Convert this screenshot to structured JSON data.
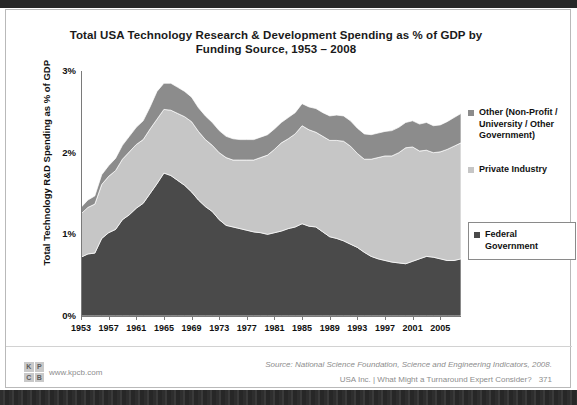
{
  "slide": {
    "title": "Total USA Technology Research & Development Spending as % of GDP by Funding Source, 1953 – 2008",
    "source": "Source: National Science Foundation, Science and Engineering Indicators, 2008.",
    "footer_text": "USA Inc. | What Might a Turnaround Expert Consider?",
    "page_number": "371",
    "brand_url": "www.kpcb.com",
    "brand_letters": [
      "K",
      "P",
      "C",
      "B"
    ]
  },
  "legend": {
    "items": [
      {
        "label": "Other (Non-Profit / University / Other Government)",
        "color": "#8c8c8c",
        "boxed": false
      },
      {
        "label": "Private Industry",
        "color": "#c6c6c6",
        "boxed": false
      },
      {
        "label": "Federal Government",
        "color": "#4a4a4a",
        "boxed": true
      }
    ]
  },
  "chart_data": {
    "type": "area",
    "stacked": true,
    "title": "Total USA Technology Research & Development Spending as % of GDP by Funding Source, 1953 – 2008",
    "xlabel": "",
    "ylabel": "Total Technology R&D Spending as % of GDP",
    "ylim": [
      0,
      3
    ],
    "yticks": [
      "0%",
      "1%",
      "2%",
      "3%"
    ],
    "ytick_values": [
      0,
      1,
      2,
      3
    ],
    "xlim": [
      1953,
      2008
    ],
    "xticks": [
      "1953",
      "1957",
      "1961",
      "1965",
      "1969",
      "1973",
      "1977",
      "1981",
      "1985",
      "1989",
      "1993",
      "1997",
      "2001",
      "2005"
    ],
    "xtick_values": [
      1953,
      1957,
      1961,
      1965,
      1969,
      1973,
      1977,
      1981,
      1985,
      1989,
      1993,
      1997,
      2001,
      2005
    ],
    "grid": false,
    "legend_position": "right",
    "x": [
      1953,
      1954,
      1955,
      1956,
      1957,
      1958,
      1959,
      1960,
      1961,
      1962,
      1963,
      1964,
      1965,
      1966,
      1967,
      1968,
      1969,
      1970,
      1971,
      1972,
      1973,
      1974,
      1975,
      1976,
      1977,
      1978,
      1979,
      1980,
      1981,
      1982,
      1983,
      1984,
      1985,
      1986,
      1987,
      1988,
      1989,
      1990,
      1991,
      1992,
      1993,
      1994,
      1995,
      1996,
      1997,
      1998,
      1999,
      2000,
      2001,
      2002,
      2003,
      2004,
      2005,
      2006,
      2007,
      2008
    ],
    "series": [
      {
        "name": "Federal Government",
        "color": "#4a4a4a",
        "values": [
          0.72,
          0.76,
          0.77,
          0.95,
          1.02,
          1.06,
          1.18,
          1.24,
          1.32,
          1.38,
          1.5,
          1.62,
          1.75,
          1.72,
          1.66,
          1.6,
          1.52,
          1.42,
          1.34,
          1.28,
          1.18,
          1.11,
          1.09,
          1.07,
          1.05,
          1.03,
          1.02,
          1.0,
          1.02,
          1.04,
          1.07,
          1.09,
          1.13,
          1.1,
          1.09,
          1.03,
          0.97,
          0.95,
          0.92,
          0.88,
          0.84,
          0.78,
          0.73,
          0.7,
          0.68,
          0.66,
          0.65,
          0.64,
          0.67,
          0.7,
          0.73,
          0.72,
          0.7,
          0.68,
          0.68,
          0.7
        ]
      },
      {
        "name": "Private Industry",
        "color": "#c6c6c6",
        "values": [
          0.53,
          0.57,
          0.6,
          0.66,
          0.69,
          0.72,
          0.74,
          0.77,
          0.78,
          0.78,
          0.79,
          0.79,
          0.78,
          0.8,
          0.82,
          0.84,
          0.86,
          0.84,
          0.82,
          0.81,
          0.82,
          0.83,
          0.82,
          0.84,
          0.86,
          0.88,
          0.92,
          0.97,
          1.02,
          1.08,
          1.1,
          1.14,
          1.2,
          1.18,
          1.16,
          1.17,
          1.18,
          1.2,
          1.22,
          1.2,
          1.15,
          1.14,
          1.19,
          1.24,
          1.28,
          1.3,
          1.35,
          1.42,
          1.4,
          1.32,
          1.3,
          1.28,
          1.31,
          1.36,
          1.4,
          1.42
        ]
      },
      {
        "name": "Other (Non-Profit / University / Other Government)",
        "color": "#8c8c8c",
        "values": [
          0.08,
          0.09,
          0.1,
          0.12,
          0.13,
          0.15,
          0.17,
          0.19,
          0.21,
          0.23,
          0.27,
          0.34,
          0.32,
          0.33,
          0.32,
          0.31,
          0.3,
          0.29,
          0.29,
          0.28,
          0.27,
          0.26,
          0.26,
          0.25,
          0.25,
          0.25,
          0.25,
          0.25,
          0.25,
          0.25,
          0.26,
          0.26,
          0.27,
          0.28,
          0.29,
          0.29,
          0.3,
          0.31,
          0.31,
          0.31,
          0.31,
          0.31,
          0.3,
          0.3,
          0.3,
          0.31,
          0.31,
          0.31,
          0.32,
          0.33,
          0.34,
          0.33,
          0.33,
          0.34,
          0.35,
          0.36
        ]
      }
    ]
  }
}
